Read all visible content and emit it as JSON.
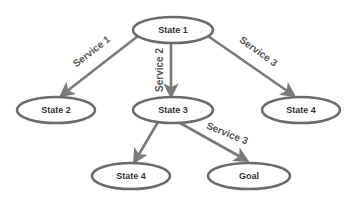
{
  "diagram": {
    "nodes": [
      {
        "id": "state1",
        "label": "State 1",
        "cx": 173,
        "cy": 30,
        "rx": 40,
        "ry": 13
      },
      {
        "id": "state2",
        "label": "State 2",
        "cx": 56,
        "cy": 110,
        "rx": 39,
        "ry": 13
      },
      {
        "id": "state3",
        "label": "State 3",
        "cx": 173,
        "cy": 110,
        "rx": 40,
        "ry": 13
      },
      {
        "id": "state4a",
        "label": "State 4",
        "cx": 301,
        "cy": 110,
        "rx": 39,
        "ry": 13
      },
      {
        "id": "state4b",
        "label": "State 4",
        "cx": 131,
        "cy": 176,
        "rx": 39,
        "ry": 13
      },
      {
        "id": "goal",
        "label": "Goal",
        "cx": 249,
        "cy": 176,
        "rx": 41,
        "ry": 13
      }
    ],
    "edges": [
      {
        "from": "state1",
        "to": "state2",
        "label": "Service 1",
        "x1": 138,
        "y1": 36,
        "x2": 62,
        "y2": 95,
        "lx": 92,
        "ly": 52,
        "angle": -38
      },
      {
        "from": "state1",
        "to": "state3",
        "label": "Service 2",
        "x1": 171,
        "y1": 43,
        "x2": 171,
        "y2": 95,
        "lx": 160,
        "ly": 70,
        "angle": -90
      },
      {
        "from": "state1",
        "to": "state4a",
        "label": "Service 3",
        "x1": 208,
        "y1": 36,
        "x2": 293,
        "y2": 95,
        "lx": 258,
        "ly": 52,
        "angle": 36
      },
      {
        "from": "state3",
        "to": "state4b",
        "label": "",
        "x1": 158,
        "y1": 122,
        "x2": 135,
        "y2": 161,
        "lx": 0,
        "ly": 0,
        "angle": 0
      },
      {
        "from": "state3",
        "to": "goal",
        "label": "Service 3",
        "x1": 180,
        "y1": 123,
        "x2": 246,
        "y2": 160,
        "lx": 227,
        "ly": 134,
        "angle": 22
      }
    ],
    "colors": {
      "stroke": "#6b6b6b",
      "edge": "#7a7a7a",
      "text": "#333333",
      "background": "#ffffff"
    }
  }
}
